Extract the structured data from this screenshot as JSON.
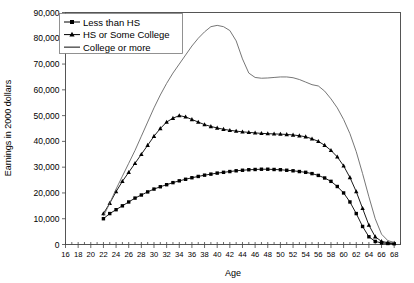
{
  "chart_data": {
    "type": "line",
    "title": "",
    "xlabel": "Age",
    "ylabel": "Earnings in 2000 dollars",
    "xlim": [
      16,
      69
    ],
    "ylim": [
      0,
      90000
    ],
    "grid": false,
    "legend_position": "top-left",
    "x_tick_labels": [
      "16",
      "18",
      "20",
      "22",
      "24",
      "26",
      "28",
      "30",
      "32",
      "34",
      "36",
      "38",
      "40",
      "42",
      "44",
      "46",
      "48",
      "50",
      "52",
      "54",
      "56",
      "58",
      "60",
      "62",
      "64",
      "66",
      "68"
    ],
    "x_tick_values": [
      16,
      18,
      20,
      22,
      24,
      26,
      28,
      30,
      32,
      34,
      36,
      38,
      40,
      42,
      44,
      46,
      48,
      50,
      52,
      54,
      56,
      58,
      60,
      62,
      64,
      66,
      68
    ],
    "y_tick_labels": [
      "0",
      "10,000",
      "20,000",
      "30,000",
      "40,000",
      "50,000",
      "60,000",
      "70,000",
      "80,000",
      "90,000"
    ],
    "y_tick_values": [
      0,
      10000,
      20000,
      30000,
      40000,
      50000,
      60000,
      70000,
      80000,
      90000
    ],
    "x": [
      22,
      23,
      24,
      25,
      26,
      27,
      28,
      29,
      30,
      31,
      32,
      33,
      34,
      35,
      36,
      37,
      38,
      39,
      40,
      41,
      42,
      43,
      44,
      45,
      46,
      47,
      48,
      49,
      50,
      51,
      52,
      53,
      54,
      55,
      56,
      57,
      58,
      59,
      60,
      61,
      62,
      63,
      64,
      65,
      66,
      67,
      68
    ],
    "series": [
      {
        "name": "Less than HS",
        "marker": "square",
        "values": [
          10000,
          12000,
          13500,
          15000,
          16500,
          18000,
          19200,
          20400,
          21500,
          22400,
          23200,
          24000,
          24700,
          25300,
          25900,
          26400,
          26900,
          27300,
          27700,
          28000,
          28300,
          28600,
          28800,
          29000,
          29100,
          29200,
          29200,
          29100,
          29000,
          28800,
          28600,
          28300,
          28000,
          27500,
          26800,
          25800,
          24500,
          22500,
          20000,
          16500,
          12000,
          7000,
          3000,
          1200,
          600,
          400,
          300
        ]
      },
      {
        "name": "HS or Some College",
        "marker": "triangle",
        "values": [
          12000,
          16000,
          20500,
          24500,
          28000,
          31500,
          35000,
          38500,
          42000,
          45000,
          47500,
          49000,
          50000,
          49500,
          48500,
          47500,
          46500,
          45800,
          45200,
          44700,
          44300,
          44000,
          43700,
          43500,
          43300,
          43100,
          43000,
          42900,
          42800,
          42700,
          42500,
          42200,
          41800,
          41000,
          40000,
          38500,
          36500,
          34000,
          30500,
          26000,
          20500,
          14000,
          7500,
          3000,
          1200,
          700,
          500
        ]
      },
      {
        "name": "College or more",
        "marker": "none",
        "values": [
          11000,
          16000,
          21500,
          26500,
          31500,
          36500,
          42000,
          47500,
          53000,
          58000,
          62500,
          66500,
          70000,
          73500,
          77000,
          80000,
          82500,
          84500,
          85000,
          84500,
          83000,
          79000,
          72000,
          66500,
          64800,
          64500,
          64600,
          64800,
          65000,
          65000,
          64700,
          64000,
          63000,
          62000,
          61500,
          59500,
          56500,
          53000,
          48500,
          43000,
          36000,
          27500,
          18500,
          10000,
          4000,
          1500,
          800
        ]
      }
    ]
  },
  "legend": {
    "entries": [
      {
        "label": "Less than HS",
        "marker": "square-line"
      },
      {
        "label": "HS or Some College",
        "marker": "triangle-line"
      },
      {
        "label": "College or more",
        "marker": "plain-line"
      }
    ]
  }
}
